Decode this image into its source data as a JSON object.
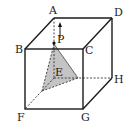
{
  "figure": {
    "type": "cube-diagram",
    "vertex_labels": {
      "A": "A",
      "B": "B",
      "C": "C",
      "D": "D",
      "E": "E",
      "F": "F",
      "G": "G",
      "H": "H",
      "P": "P"
    },
    "colors": {
      "edge": "#1a1a1a",
      "shade": "#bdbdbd",
      "label": "#222222"
    }
  }
}
